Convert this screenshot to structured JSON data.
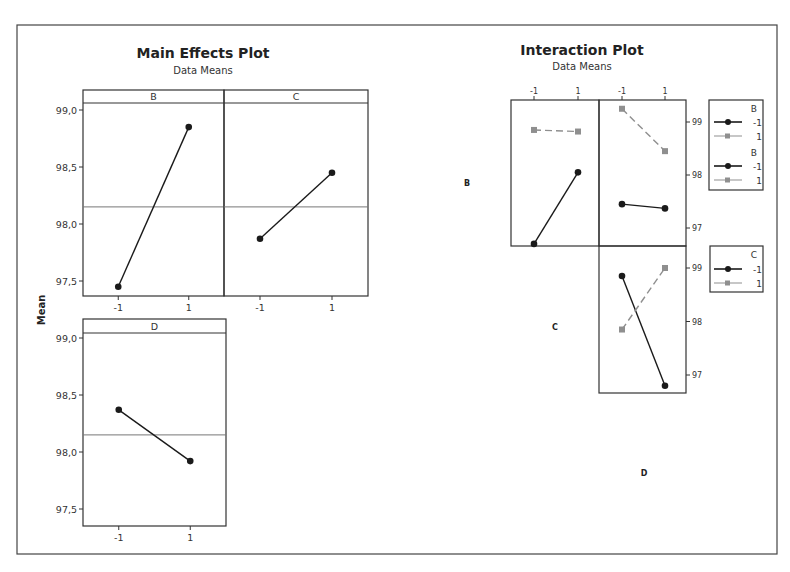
{
  "chart_data": [
    {
      "type": "line",
      "title": "Main Effects Plot",
      "subtitle": "Data Means",
      "ylabel": "Mean",
      "ylim": [
        97.35,
        99.15
      ],
      "yticks": [
        "99,0",
        "98,5",
        "98,0",
        "97,5"
      ],
      "ytick_values": [
        99.0,
        98.5,
        98.0,
        97.5
      ],
      "grand_mean": 98.15,
      "categories": [
        "-1",
        "1"
      ],
      "panels": [
        {
          "factor": "B",
          "values": [
            97.45,
            98.85
          ]
        },
        {
          "factor": "C",
          "values": [
            97.87,
            98.45
          ]
        },
        {
          "factor": "D",
          "values": [
            98.37,
            97.92
          ]
        }
      ]
    },
    {
      "type": "line",
      "title": "Interaction Plot",
      "subtitle": "Data Means",
      "yticks": [
        "99",
        "98",
        "97"
      ],
      "ytick_values": [
        99,
        98,
        97
      ],
      "x_ticks": [
        "-1",
        "1"
      ],
      "row_labels": [
        "B",
        "C",
        "D"
      ],
      "panels": [
        {
          "row": "B",
          "col": "C",
          "series": [
            {
              "name": "B = -1",
              "values": [
                96.7,
                98.05
              ],
              "style": "solid-black-circle"
            },
            {
              "name": "B = 1",
              "values": [
                98.85,
                98.82
              ],
              "style": "dashed-gray-square"
            }
          ]
        },
        {
          "row": "B",
          "col": "D",
          "series": [
            {
              "name": "B = -1",
              "values": [
                97.45,
                97.37
              ],
              "style": "solid-black-circle"
            },
            {
              "name": "B = 1",
              "values": [
                99.25,
                98.45
              ],
              "style": "dashed-gray-square"
            }
          ]
        },
        {
          "row": "C",
          "col": "D",
          "series": [
            {
              "name": "C = -1",
              "values": [
                98.85,
                96.8
              ],
              "style": "solid-black-circle"
            },
            {
              "name": "C = 1",
              "values": [
                97.85,
                99.0
              ],
              "style": "dashed-gray-square"
            }
          ]
        }
      ],
      "legends": [
        {
          "title": "B",
          "entries": [
            "-1",
            "1"
          ]
        },
        {
          "title": "B",
          "entries": [
            "-1",
            "1"
          ]
        },
        {
          "title": "C",
          "entries": [
            "-1",
            "1"
          ]
        }
      ]
    }
  ],
  "colors": {
    "series1": "#1a1a1a",
    "series2": "#8f8f8f",
    "frame": "#333333"
  }
}
